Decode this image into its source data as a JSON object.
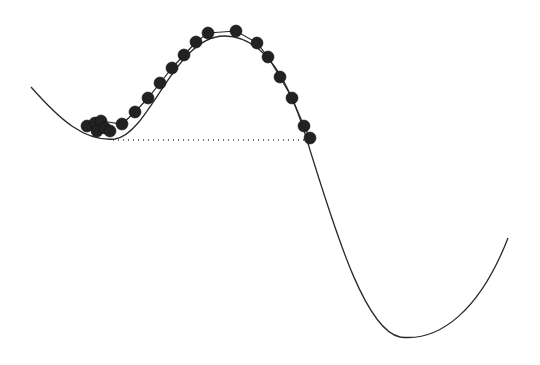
{
  "diagram": {
    "colors": {
      "background": "#ffffff",
      "curve": "#2a2a2a",
      "bead": "#222222"
    },
    "curve_path": "M 31 87 C 60 120, 85 142, 115 139 C 150 134, 175 35, 225 36 C 265 37, 290 80, 310 150 C 335 230, 365 330, 400 337 C 440 342, 480 310, 508 238",
    "chain_path": "M 87 126 L 101 121 L 122 124 L 135 112 L 148 98 L 160 83 L 172 68 L 184 55 L 196 42 L 208 33 L 236 31 L 257 43 L 268 57 L 280 77 L 292 98 L 304 126 L 310 138",
    "baseline": {
      "x1": 113,
      "y1": 140,
      "x2": 305,
      "y2": 140
    },
    "bead_radius": 6,
    "beads": [
      {
        "x": 87,
        "y": 126
      },
      {
        "x": 95,
        "y": 123
      },
      {
        "x": 101,
        "y": 121
      },
      {
        "x": 97,
        "y": 131
      },
      {
        "x": 105,
        "y": 128
      },
      {
        "x": 110,
        "y": 131
      },
      {
        "x": 122,
        "y": 124
      },
      {
        "x": 135,
        "y": 112
      },
      {
        "x": 148,
        "y": 98
      },
      {
        "x": 160,
        "y": 83
      },
      {
        "x": 172,
        "y": 68
      },
      {
        "x": 184,
        "y": 55
      },
      {
        "x": 196,
        "y": 42
      },
      {
        "x": 208,
        "y": 33
      },
      {
        "x": 236,
        "y": 31
      },
      {
        "x": 257,
        "y": 43
      },
      {
        "x": 268,
        "y": 57
      },
      {
        "x": 280,
        "y": 77
      },
      {
        "x": 292,
        "y": 98
      },
      {
        "x": 304,
        "y": 126
      },
      {
        "x": 310,
        "y": 138
      }
    ]
  }
}
